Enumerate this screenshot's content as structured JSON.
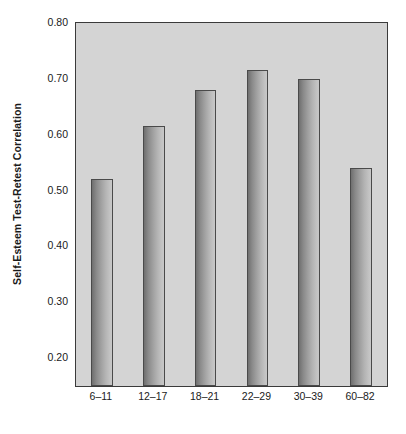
{
  "chart_data": {
    "type": "bar",
    "title": "",
    "subtitle": "",
    "xlabel": "",
    "ylabel": "Self-Esteem Test-Retest Correlation",
    "categories": [
      "6–11",
      "12–17",
      "18–21",
      "22–29",
      "30–39",
      "60–82"
    ],
    "values": [
      0.52,
      0.615,
      0.68,
      0.715,
      0.7,
      0.54
    ],
    "ylim": [
      0.15,
      0.8
    ],
    "yticks": [
      0.8,
      0.7,
      0.6,
      0.5,
      0.4,
      0.3,
      0.2
    ],
    "ytick_labels": [
      "0.80",
      "0.70",
      "0.60",
      "0.50",
      "0.40",
      "0.30",
      "0.20"
    ],
    "grid": false,
    "legend": null,
    "legend_position": "none",
    "annotations": [],
    "colors": {
      "plot_background": "#d4d4d4",
      "figure_background": "#ffffff",
      "axis_line": "#3a3a3a",
      "bar_edge": "#4a4a4a",
      "bar_fill_dark": "#6f6f6f",
      "bar_fill_light": "#c8c8c8",
      "text": "#1a1a1a"
    }
  }
}
